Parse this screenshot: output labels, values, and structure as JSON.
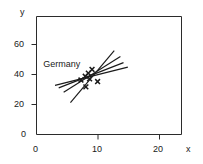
{
  "chart_data": {
    "type": "scatter",
    "title": "",
    "xlabel": "x",
    "ylabel": "y",
    "xlim": [
      0,
      23.5
    ],
    "ylim": [
      0,
      78
    ],
    "xticks": [
      0,
      10,
      20
    ],
    "xticklabels": [
      "0",
      "10",
      "20"
    ],
    "yticks": [
      0,
      20,
      40,
      60
    ],
    "yticklabels": [
      "0",
      "20",
      "40",
      "60"
    ],
    "grid": false,
    "legend": null,
    "annotations": [
      {
        "text": "Germany",
        "x": 1.1,
        "y": 46.5
      }
    ],
    "series": [
      {
        "name": "observations",
        "marker": "x",
        "points": [
          {
            "x": 7.2,
            "y": 36.0
          },
          {
            "x": 7.9,
            "y": 38.5
          },
          {
            "x": 8.4,
            "y": 40.5
          },
          {
            "x": 8.6,
            "y": 36.8
          },
          {
            "x": 9.0,
            "y": 43.0
          },
          {
            "x": 8.0,
            "y": 31.5
          },
          {
            "x": 9.9,
            "y": 35.0
          }
        ]
      }
    ],
    "fit_lines": [
      {
        "name": "fit-line-1",
        "x0": 3.0,
        "y0": 32.5,
        "x1": 14.8,
        "y1": 44.5
      },
      {
        "name": "fit-line-2",
        "x0": 3.6,
        "y0": 30.8,
        "x1": 14.1,
        "y1": 47.5
      },
      {
        "name": "fit-line-3",
        "x0": 4.4,
        "y0": 28.0,
        "x1": 13.6,
        "y1": 51.5
      },
      {
        "name": "fit-line-4",
        "x0": 5.5,
        "y0": 21.0,
        "x1": 12.6,
        "y1": 55.5
      }
    ],
    "colors": {
      "axis": "#1a1a1a",
      "marker": "#1a1a1a",
      "line": "#1a1a1a",
      "background": "#ffffff"
    }
  },
  "axes": {
    "y_axis_name": "y",
    "x_axis_name": "x"
  }
}
